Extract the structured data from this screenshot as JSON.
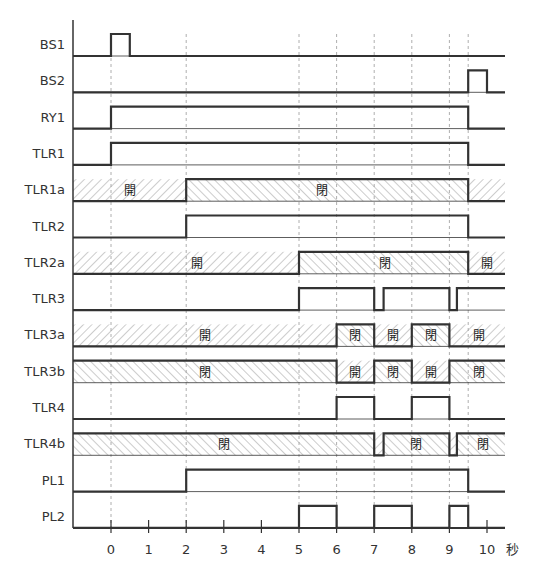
{
  "chart_data": {
    "type": "timing",
    "xlabel": "秒",
    "x_ticks": [
      0,
      1,
      2,
      3,
      4,
      5,
      6,
      7,
      8,
      9,
      10
    ],
    "x_range": [
      -1,
      10.5
    ],
    "guide_lines": [
      0,
      2,
      5,
      6,
      7,
      8,
      9,
      9.5
    ],
    "colors": {
      "line": "#333333",
      "hatch": "#888888",
      "guide": "#999999",
      "text": "#333333"
    },
    "signals": [
      {
        "name": "BS1",
        "kind": "digital",
        "edges": [
          [
            -1,
            0
          ],
          [
            0,
            1
          ],
          [
            0.5,
            0
          ]
        ]
      },
      {
        "name": "BS2",
        "kind": "digital",
        "edges": [
          [
            -1,
            0
          ],
          [
            9.5,
            1
          ],
          [
            10,
            0
          ]
        ]
      },
      {
        "name": "RY1",
        "kind": "digital",
        "edges": [
          [
            -1,
            0
          ],
          [
            0,
            1
          ],
          [
            9.5,
            0
          ]
        ]
      },
      {
        "name": "TLR1",
        "kind": "digital",
        "edges": [
          [
            -1,
            0
          ],
          [
            0,
            1
          ],
          [
            9.5,
            0
          ]
        ]
      },
      {
        "name": "TLR1a",
        "kind": "contact",
        "edges": [
          [
            -1,
            0
          ],
          [
            2,
            1
          ],
          [
            9.5,
            0
          ]
        ],
        "labels": [
          {
            "t": 0.5,
            "text": "開"
          },
          {
            "t": 5.6,
            "text": "閉"
          }
        ]
      },
      {
        "name": "TLR2",
        "kind": "digital",
        "edges": [
          [
            -1,
            0
          ],
          [
            2,
            1
          ],
          [
            9.5,
            0
          ]
        ]
      },
      {
        "name": "TLR2a",
        "kind": "contact",
        "edges": [
          [
            -1,
            0
          ],
          [
            5,
            1
          ],
          [
            9.5,
            0
          ]
        ],
        "labels": [
          {
            "t": 2.3,
            "text": "開"
          },
          {
            "t": 7.3,
            "text": "閉"
          },
          {
            "t": 10.0,
            "text": "開"
          }
        ]
      },
      {
        "name": "TLR3",
        "kind": "digital",
        "edges": [
          [
            -1,
            0
          ],
          [
            5,
            1
          ],
          [
            7,
            0
          ],
          [
            7.25,
            1
          ],
          [
            9,
            0
          ],
          [
            9.2,
            1
          ]
        ]
      },
      {
        "name": "TLR3a",
        "kind": "contact",
        "edges": [
          [
            -1,
            0
          ],
          [
            6,
            1
          ],
          [
            7,
            0
          ],
          [
            8,
            1
          ],
          [
            9,
            0
          ]
        ],
        "labels": [
          {
            "t": 2.5,
            "text": "開"
          },
          {
            "t": 6.5,
            "text": "閉"
          },
          {
            "t": 7.5,
            "text": "開"
          },
          {
            "t": 8.5,
            "text": "閉"
          },
          {
            "t": 9.8,
            "text": "開"
          }
        ]
      },
      {
        "name": "TLR3b",
        "kind": "contact",
        "edges": [
          [
            -1,
            1
          ],
          [
            6,
            0
          ],
          [
            7,
            1
          ],
          [
            8,
            0
          ],
          [
            9,
            1
          ]
        ],
        "labels": [
          {
            "t": 2.5,
            "text": "閉"
          },
          {
            "t": 6.5,
            "text": "開"
          },
          {
            "t": 7.5,
            "text": "閉"
          },
          {
            "t": 8.5,
            "text": "開"
          },
          {
            "t": 9.8,
            "text": "閉"
          }
        ]
      },
      {
        "name": "TLR4",
        "kind": "digital",
        "edges": [
          [
            -1,
            0
          ],
          [
            6,
            1
          ],
          [
            7,
            0
          ],
          [
            8,
            1
          ],
          [
            9,
            0
          ]
        ]
      },
      {
        "name": "TLR4b",
        "kind": "contact",
        "edges": [
          [
            -1,
            1
          ],
          [
            7,
            0
          ],
          [
            7.25,
            1
          ],
          [
            9,
            0
          ],
          [
            9.2,
            1
          ]
        ],
        "labels": [
          {
            "t": 3.0,
            "text": "閉"
          },
          {
            "t": 8.1,
            "text": "閉"
          },
          {
            "t": 9.9,
            "text": "閉"
          }
        ]
      },
      {
        "name": "PL1",
        "kind": "digital",
        "edges": [
          [
            -1,
            0
          ],
          [
            2,
            1
          ],
          [
            9.5,
            0
          ]
        ]
      },
      {
        "name": "PL2",
        "kind": "digital",
        "edges": [
          [
            -1,
            0
          ],
          [
            5,
            1
          ],
          [
            6,
            0
          ],
          [
            7,
            1
          ],
          [
            8,
            0
          ],
          [
            9,
            1
          ],
          [
            9.5,
            0
          ]
        ]
      }
    ],
    "state_legend": {
      "open": "開",
      "closed": "閉"
    }
  }
}
